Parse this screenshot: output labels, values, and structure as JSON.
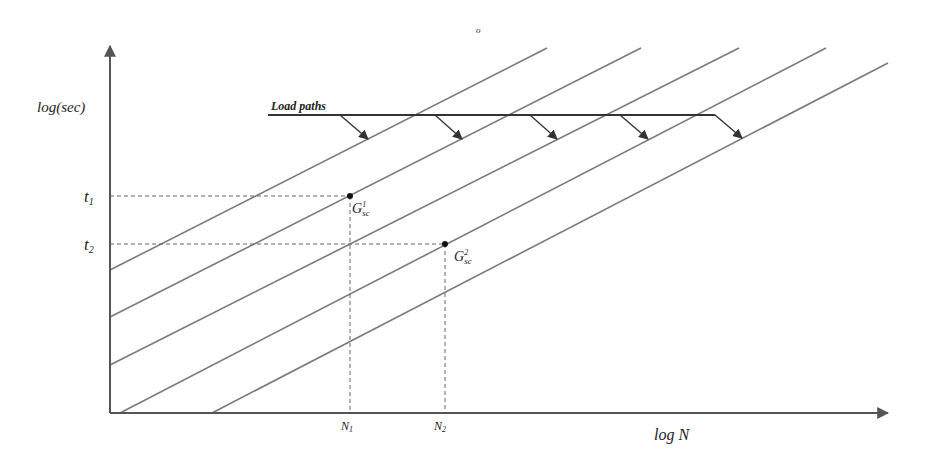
{
  "diagram": {
    "y_axis_label": "log(sec)",
    "x_axis_label": "log N",
    "stray_mark": "o",
    "load_paths_label": "Load paths",
    "y_ticks": [
      {
        "id": "t1",
        "base": "t",
        "sub": "1"
      },
      {
        "id": "t2",
        "base": "t",
        "sub": "2"
      }
    ],
    "x_ticks": [
      {
        "id": "N1",
        "base": "N",
        "sub": "1"
      },
      {
        "id": "N2",
        "base": "N",
        "sub": "2"
      }
    ],
    "points": [
      {
        "id": "G1",
        "base": "G",
        "sup": "1",
        "sub": "sc",
        "at": [
          "N1",
          "t1"
        ]
      },
      {
        "id": "G2",
        "base": "G",
        "sup": "2",
        "sub": "sc",
        "at": [
          "N2",
          "t2"
        ]
      }
    ],
    "parallel_curve_count": 5,
    "load_path_arrow_count": 5
  }
}
